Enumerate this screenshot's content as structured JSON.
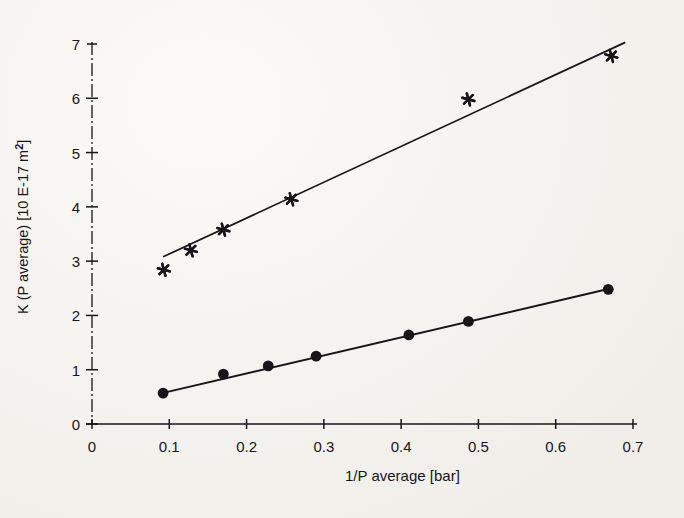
{
  "figure": {
    "background_color": "#f4f2ee",
    "ink_color": "#16161a"
  },
  "axes": {
    "x_title": "1/P average [bar]",
    "y_title_prefix": "K (P average) [10 E-17 m",
    "y_title_exponent": "2",
    "y_title_suffix": "]",
    "y_title_full": "K (P average) [10 E-17 m2]",
    "x_tick_labels": [
      "0",
      "0.1",
      "0.2",
      "0.3",
      "0.4",
      "0.5",
      "0.6",
      "0.7"
    ],
    "y_tick_labels": [
      "0",
      "1",
      "2",
      "3",
      "4",
      "5",
      "6",
      "7"
    ]
  },
  "chart_data": {
    "type": "scatter",
    "title": "",
    "subtitle": "",
    "xlabel": "1/P average [bar]",
    "ylabel": "K (P average) [10 E-17 m2]",
    "xlim": [
      0,
      0.7
    ],
    "ylim": [
      0,
      7
    ],
    "xticks": [
      0,
      0.1,
      0.2,
      0.3,
      0.4,
      0.5,
      0.6,
      0.7
    ],
    "yticks": [
      0,
      1,
      2,
      3,
      4,
      5,
      6,
      7
    ],
    "grid": false,
    "legend": "none",
    "series": [
      {
        "name": "upper series",
        "marker": "asterisk",
        "color": "#16161a",
        "points": [
          {
            "x": 0.093,
            "y": 2.84
          },
          {
            "x": 0.128,
            "y": 3.2
          },
          {
            "x": 0.17,
            "y": 3.58
          },
          {
            "x": 0.258,
            "y": 4.14
          },
          {
            "x": 0.487,
            "y": 5.98
          },
          {
            "x": 0.672,
            "y": 6.78
          }
        ],
        "fit_line": {
          "x1": 0.092,
          "y1": 3.08,
          "x2": 0.69,
          "y2": 7.03
        }
      },
      {
        "name": "lower series",
        "marker": "circle",
        "color": "#16161a",
        "points": [
          {
            "x": 0.092,
            "y": 0.57
          },
          {
            "x": 0.17,
            "y": 0.92
          },
          {
            "x": 0.228,
            "y": 1.07
          },
          {
            "x": 0.29,
            "y": 1.25
          },
          {
            "x": 0.41,
            "y": 1.64
          },
          {
            "x": 0.487,
            "y": 1.89
          },
          {
            "x": 0.668,
            "y": 2.48
          }
        ],
        "fit_line": {
          "x1": 0.088,
          "y1": 0.56,
          "x2": 0.672,
          "y2": 2.5
        }
      }
    ]
  }
}
